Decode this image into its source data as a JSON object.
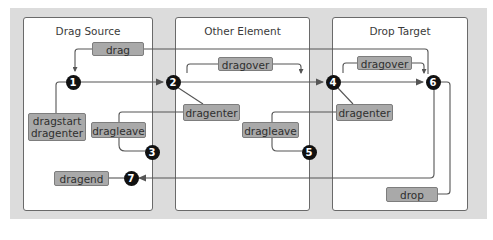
{
  "panels": {
    "drag_source": {
      "title": "Drag Source"
    },
    "other_element": {
      "title": "Other Element"
    },
    "drop_target": {
      "title": "Drop Target"
    }
  },
  "events": {
    "drag": "drag",
    "dragover_other": "dragover",
    "dragover_target": "dragover",
    "dragstart_line1": "dragstart",
    "dragstart_line2": "dragenter",
    "dragleave_source": "dragleave",
    "dragenter_other": "dragenter",
    "dragleave_other": "dragleave",
    "dragenter_target": "dragenter",
    "dragend": "dragend",
    "drop": "drop"
  },
  "steps": [
    "1",
    "2",
    "3",
    "4",
    "5",
    "6",
    "7"
  ],
  "colors": {
    "background": "#dcdcdc",
    "panel": "#ffffff",
    "tag_fill": "#a9a9a9",
    "line": "#555555",
    "node": "#111111"
  }
}
